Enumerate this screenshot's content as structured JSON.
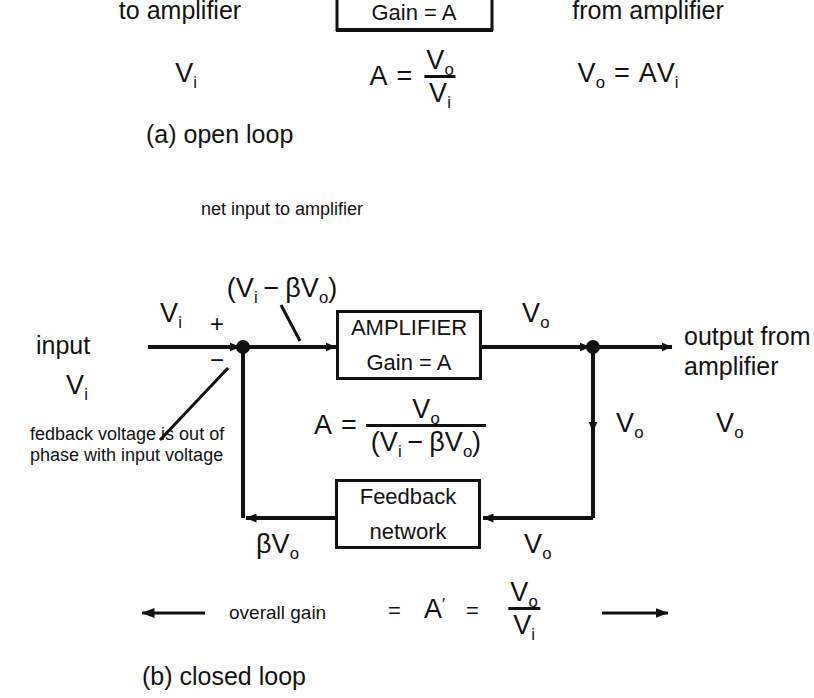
{
  "figure": {
    "ink_color": "#111111",
    "background": "#ffffff"
  },
  "open_loop": {
    "caption": "(a) open loop",
    "input_label_line1": "to",
    "input_label_line2": "amplifier",
    "input_symbol": {
      "base": "V",
      "sub": "i"
    },
    "amplifier_box": {
      "gain_text": "Gain = A"
    },
    "gain_equation": {
      "lhs": "A",
      "equals": "=",
      "numerator": {
        "base": "V",
        "sub": "o"
      },
      "denominator": {
        "base": "V",
        "sub": "i"
      }
    },
    "output_label_line1": "from",
    "output_label_line2": "amplifier",
    "output_equation": {
      "lhs_base": "V",
      "lhs_sub": "o",
      "equals": "=",
      "rhs_prefix": "A",
      "rhs_base": "V",
      "rhs_sub": "i"
    }
  },
  "closed_loop": {
    "caption": "(b) closed loop",
    "input_word": "input",
    "input_symbol": {
      "base": "V",
      "sub": "i"
    },
    "input_arrow_label": {
      "base": "V",
      "sub": "i"
    },
    "summing_plus": "+",
    "summing_minus": "−",
    "phase_note_line1": "fedback voltage",
    "phase_note_line2": "is out of phase",
    "phase_note_line3": "with input voltage",
    "net_input_line1": "net input",
    "net_input_line2": "to",
    "net_input_line3": "amplifier",
    "net_input_expression": {
      "open_paren": "(",
      "first_base": "V",
      "first_sub": "i",
      "minus": "−",
      "beta": "β",
      "second_base": "V",
      "second_sub": "o",
      "close_paren": ")"
    },
    "amplifier_box": {
      "title": "AMPLIFIER",
      "gain_text": "Gain = A"
    },
    "gain_equation": {
      "lhs": "A",
      "equals": "=",
      "numerator": {
        "base": "V",
        "sub": "o"
      },
      "denominator_text": "(V i − βV o )"
    },
    "amp_output_label": {
      "base": "V",
      "sub": "o"
    },
    "tap_down_label": {
      "base": "V",
      "sub": "o"
    },
    "output_word_line1": "output",
    "output_word_line2": "from",
    "output_word_line3": "amplifier",
    "output_symbol": {
      "base": "V",
      "sub": "o"
    },
    "feedback_box": {
      "line1": "Feedback",
      "line2": "network"
    },
    "feedback_left_label": {
      "beta": "β",
      "base": "V",
      "sub": "o"
    },
    "feedback_right_label": {
      "base": "V",
      "sub": "o"
    },
    "overall_gain": {
      "text": "overall gain",
      "equals1": "=",
      "symbol": "A",
      "prime": "′",
      "equals2": "=",
      "numerator": {
        "base": "V",
        "sub": "o"
      },
      "denominator": {
        "base": "V",
        "sub": "i"
      }
    }
  }
}
